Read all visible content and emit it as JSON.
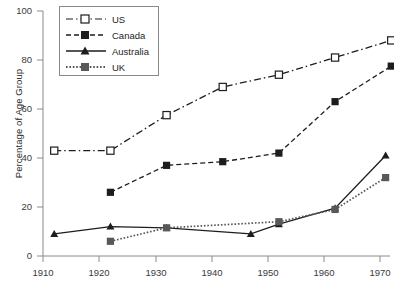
{
  "chart_data": {
    "type": "line",
    "title": "",
    "xlabel": "",
    "ylabel": "Percentage of Age Group",
    "xlim": [
      1910,
      1975
    ],
    "ylim": [
      0,
      100
    ],
    "xticks": [
      1910,
      1920,
      1930,
      1940,
      1950,
      1960,
      1970
    ],
    "yticks": [
      0,
      20,
      40,
      60,
      80,
      100
    ],
    "grid": false,
    "legend_position": "top-left",
    "series": [
      {
        "name": "US",
        "color": "#1d1d1d",
        "marker": "open-square",
        "linestyle": "dash-dot",
        "x": [
          1912,
          1922,
          1932,
          1942,
          1952,
          1962,
          1972
        ],
        "values": [
          43,
          43,
          57.5,
          69,
          74,
          81,
          88
        ]
      },
      {
        "name": "Canada",
        "color": "#1d1d1d",
        "marker": "filled-square",
        "linestyle": "dashed",
        "x": [
          1922,
          1932,
          1942,
          1952,
          1962,
          1972
        ],
        "values": [
          26,
          37,
          38.5,
          42,
          63,
          77.5
        ]
      },
      {
        "name": "Australia",
        "color": "#1d1d1d",
        "marker": "filled-triangle",
        "linestyle": "solid",
        "x": [
          1912,
          1922,
          1932,
          1947,
          1952,
          1962,
          1971
        ],
        "values": [
          9,
          12,
          11.5,
          9,
          13,
          19.5,
          41
        ]
      },
      {
        "name": "UK",
        "color": "#585858",
        "marker": "filled-square",
        "linestyle": "dotted",
        "x": [
          1922,
          1932,
          1952,
          1962,
          1971
        ],
        "values": [
          6,
          11.5,
          14,
          19,
          32
        ]
      }
    ]
  },
  "axis": {
    "y_label": "Percentage of Age Group",
    "y_tick_labels": [
      "100",
      "80",
      "60",
      "40",
      "20",
      "0"
    ],
    "x_tick_labels": [
      "1910",
      "1920",
      "1930",
      "1940",
      "1950",
      "1960",
      "1970"
    ]
  },
  "legend": {
    "entries": [
      {
        "label": "US"
      },
      {
        "label": "Canada"
      },
      {
        "label": "Australia"
      },
      {
        "label": "UK"
      }
    ]
  }
}
